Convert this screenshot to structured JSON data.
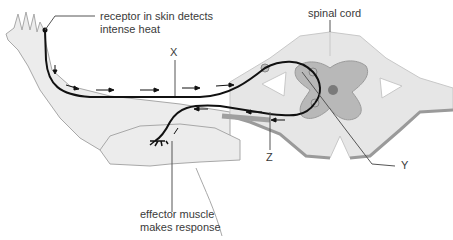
{
  "labels": {
    "receptor_line1": "receptor in skin detects",
    "receptor_line2": "intense heat",
    "spinal_cord": "spinal cord",
    "x": "X",
    "y": "Y",
    "z": "Z",
    "effector_line1": "effector muscle",
    "effector_line2": "makes response"
  },
  "colors": {
    "skin": "#ececec",
    "skin_outline": "#a8a8a8",
    "white_matter": "#e6e6e6",
    "grey_matter": "#b8b8b8",
    "nerve": "#111111",
    "label_text": "#3a3a3a"
  }
}
